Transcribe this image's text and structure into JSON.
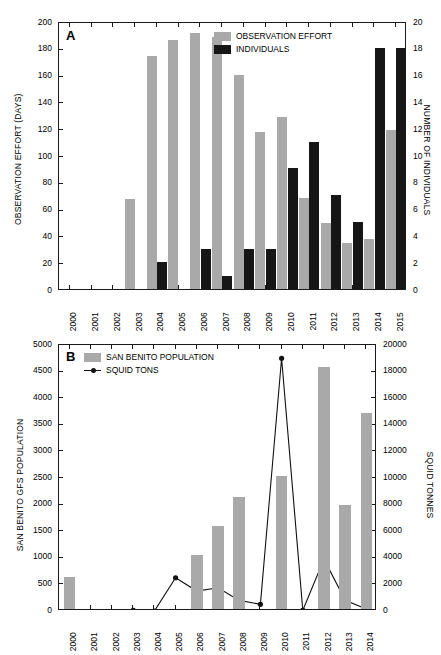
{
  "figure": {
    "background": "#ffffff",
    "bar_gray": "#a9a9a9",
    "bar_black": "#161616",
    "line_color": "#111111"
  },
  "panel_a": {
    "letter": "A",
    "legend": [
      {
        "label": "OBSERVATION EFFORT",
        "marker": "gray-swatch"
      },
      {
        "label": "INDIVIDUALS",
        "marker": "black-swatch"
      }
    ],
    "left_axis": {
      "title": "OBSERVATION EFFORT (DAYS)",
      "ticks": [
        "0",
        "20",
        "40",
        "60",
        "80",
        "100",
        "120",
        "140",
        "160",
        "180",
        "200"
      ]
    },
    "right_axis": {
      "title": "NUMBER OF INDIVIDUALS",
      "ticks": [
        "0",
        "2",
        "4",
        "6",
        "8",
        "10",
        "12",
        "14",
        "16",
        "18",
        "20"
      ]
    },
    "x_ticks": [
      "2000",
      "2001",
      "2002",
      "2003",
      "2004",
      "2005",
      "2006",
      "2007",
      "2008",
      "2009",
      "2010",
      "2011",
      "2012",
      "2013",
      "2014",
      "2015"
    ]
  },
  "panel_b": {
    "letter": "B",
    "legend": [
      {
        "label": "SAN BENITO POPULATION",
        "marker": "gray-swatch"
      },
      {
        "label": "SQUID TONS",
        "marker": "line-marker"
      }
    ],
    "left_axis": {
      "title": "SAN BENITO GFS POPULATION",
      "ticks": [
        "0",
        "500",
        "1000",
        "1500",
        "2000",
        "2500",
        "3000",
        "3500",
        "4000",
        "4500",
        "5000"
      ]
    },
    "right_axis": {
      "title": "SQUID TONNES",
      "ticks": [
        "0",
        "2000",
        "4000",
        "6000",
        "8000",
        "10000",
        "12000",
        "14000",
        "16000",
        "18000",
        "20000"
      ]
    },
    "x_ticks": [
      "2000",
      "2001",
      "2002",
      "2003",
      "2004",
      "2005",
      "2006",
      "2007",
      "2008",
      "2009",
      "2010",
      "2011",
      "2012",
      "2013",
      "2014"
    ]
  },
  "chart_data": [
    {
      "panel": "A",
      "type": "bar",
      "title": "",
      "xlabel": "",
      "categories": [
        "2000",
        "2001",
        "2002",
        "2003",
        "2004",
        "2005",
        "2006",
        "2007",
        "2008",
        "2009",
        "2010",
        "2011",
        "2012",
        "2013",
        "2014",
        "2015"
      ],
      "grid": false,
      "legend_position": "top-right",
      "series": [
        {
          "name": "OBSERVATION EFFORT",
          "axis": "left",
          "ylabel": "OBSERVATION EFFORT (DAYS)",
          "ylim": [
            0,
            200
          ],
          "ytick_step": 20,
          "color": "#a9a9a9",
          "values": [
            0,
            0,
            0,
            67,
            174,
            186,
            191,
            188,
            160,
            117,
            128,
            68,
            49,
            34,
            37,
            119
          ]
        },
        {
          "name": "INDIVIDUALS",
          "axis": "right",
          "ylabel": "NUMBER OF INDIVIDUALS",
          "ylim": [
            0,
            20
          ],
          "ytick_step": 2,
          "color": "#161616",
          "values": [
            0,
            0,
            0,
            0,
            2,
            0,
            3,
            1,
            3,
            3,
            9,
            11,
            7,
            5,
            18,
            18
          ]
        }
      ]
    },
    {
      "panel": "B",
      "type": "bar",
      "title": "",
      "xlabel": "",
      "categories": [
        "2000",
        "2001",
        "2002",
        "2003",
        "2004",
        "2005",
        "2006",
        "2007",
        "2008",
        "2009",
        "2010",
        "2011",
        "2012",
        "2013",
        "2014"
      ],
      "grid": false,
      "legend_position": "top-left",
      "series": [
        {
          "name": "SAN BENITO POPULATION",
          "axis": "left",
          "ylabel": "SAN BENITO GFS POPULATION",
          "ylim": [
            0,
            5000
          ],
          "ytick_step": 500,
          "color": "#a9a9a9",
          "type": "bar",
          "values": [
            600,
            0,
            0,
            0,
            0,
            0,
            1010,
            1560,
            2100,
            0,
            2500,
            0,
            4550,
            1950,
            3680
          ]
        },
        {
          "name": "SQUID TONS",
          "axis": "right",
          "ylabel": "SQUID TONNES",
          "ylim": [
            0,
            20000
          ],
          "ytick_step": 2000,
          "color": "#111111",
          "type": "line",
          "values": [
            null,
            null,
            null,
            50,
            0,
            2500,
            1500,
            1750,
            800,
            500,
            19000,
            50,
            3900,
            800,
            150
          ]
        }
      ]
    }
  ]
}
